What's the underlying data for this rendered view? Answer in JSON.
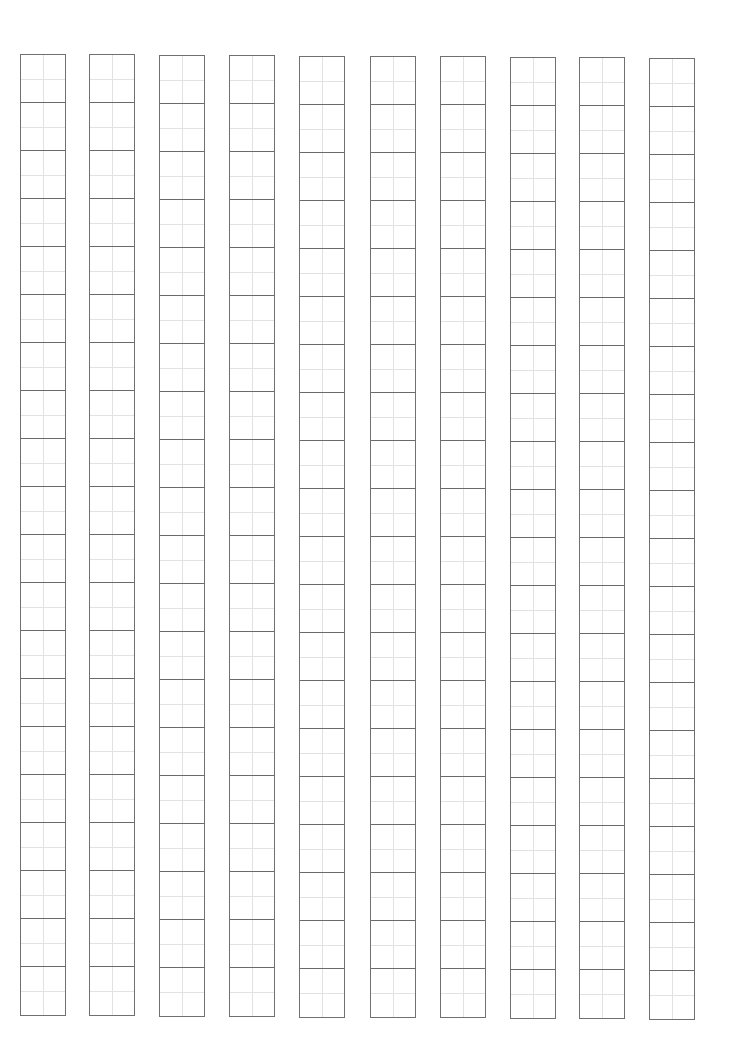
{
  "sheet": {
    "type": "tianzige-practice-grid",
    "columns": 10,
    "rows_per_column": 20,
    "column_lefts": [
      20,
      89,
      159,
      229,
      299,
      370,
      440,
      510,
      579,
      649
    ],
    "column_tops": [
      54,
      54,
      55,
      55,
      56,
      56,
      56,
      57,
      57,
      58
    ],
    "column_width": 46,
    "cell_height": 48,
    "colors": {
      "background": "#ffffff",
      "border": "#707070",
      "cell_divider": "#6a6a6a",
      "guide_line": "#e2e2e2"
    }
  }
}
